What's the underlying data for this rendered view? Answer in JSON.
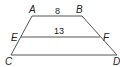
{
  "diagram": {
    "type": "trapezoid-midsegment",
    "vertices": {
      "A": {
        "label": "A",
        "x": 32,
        "y": 16
      },
      "B": {
        "label": "B",
        "x": 82,
        "y": 16
      },
      "C": {
        "label": "C",
        "x": 11,
        "y": 55
      },
      "D": {
        "label": "D",
        "x": 117,
        "y": 55
      },
      "E": {
        "label": "E",
        "x": 21,
        "y": 37
      },
      "F": {
        "label": "F",
        "x": 100,
        "y": 37
      }
    },
    "segments": {
      "AB": {
        "length_label": "8"
      },
      "EF": {
        "length_label": "13"
      }
    },
    "stroke_color": "#555555"
  }
}
